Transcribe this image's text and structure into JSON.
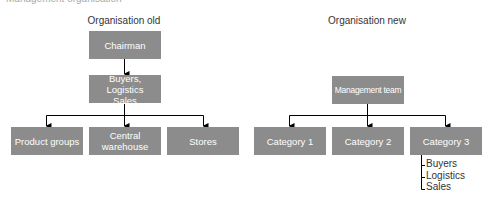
{
  "figure": {
    "cut_title": "Management organisation"
  },
  "old": {
    "heading": "Organisation old",
    "top": "Chairman",
    "middle_line1": "Buyers, Logistics",
    "middle_line2": "Sales",
    "children": [
      {
        "line1": "Product groups",
        "line2": ""
      },
      {
        "line1": "Central",
        "line2": "warehouse"
      },
      {
        "line1": "Stores",
        "line2": ""
      }
    ]
  },
  "new": {
    "heading": "Organisation new",
    "top": "Management team",
    "children": [
      {
        "label": "Category 1"
      },
      {
        "label": "Category 2"
      },
      {
        "label": "Category 3"
      }
    ],
    "category3_sublist": [
      "Buyers",
      "Logistics",
      "Sales"
    ]
  },
  "colors": {
    "box_fill": "#8c8c8c",
    "box_text": "#ffffff",
    "line": "#000000"
  }
}
